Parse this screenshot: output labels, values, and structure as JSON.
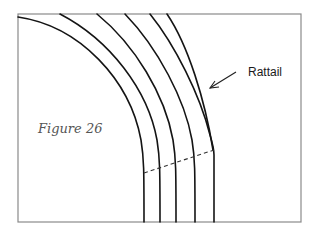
{
  "figure": {
    "caption": "Figure 26",
    "callout_label": "Rattail",
    "colors": {
      "background": "#ffffff",
      "frame": "#8a8a8a",
      "lines": "#141414",
      "caption": "#555555"
    },
    "arcs": 5,
    "vertical_line_x": [
      144,
      160,
      176,
      195,
      214
    ],
    "dashed_line": {
      "from": [
        144,
        172
      ],
      "to": [
        214,
        150
      ]
    }
  }
}
